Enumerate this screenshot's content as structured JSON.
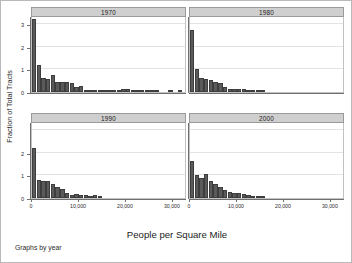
{
  "figure": {
    "xlabel": "People per Square Mile",
    "ylabel": "Fraction of Total Tracts",
    "note": "Graphs by year",
    "bar_color": "#5a5a5a",
    "panel_header_color": "#cfcfcf"
  },
  "chart_data": {
    "type": "bar",
    "title": "",
    "xlabel": "People per Square Mile",
    "ylabel": "Fraction of Total Tracts",
    "xlim": [
      0,
      33000
    ],
    "ylim": [
      0,
      3.35
    ],
    "xticks": [
      0,
      10000,
      20000,
      30000
    ],
    "xticklabels": [
      "0",
      "10,000",
      "20,000",
      "30,000"
    ],
    "yticks": [
      0,
      1,
      2,
      3
    ],
    "yticklabels": [
      "0",
      "1",
      "2",
      "3"
    ],
    "grid": true,
    "legend": "none",
    "layout": "2x2 small multiples by year",
    "bin_width": 1000,
    "panels": [
      {
        "title": "1970",
        "row": 0,
        "col": 0,
        "bin_centers": [
          500,
          1500,
          2500,
          3500,
          4500,
          5500,
          6500,
          7500,
          8500,
          9500,
          10500,
          11500,
          12500,
          13500,
          14500,
          15500,
          16500,
          17500,
          18500,
          19500,
          20500,
          21500,
          22500,
          23500,
          24500,
          25500,
          26500,
          27500,
          28500,
          29500,
          30500,
          31500
        ],
        "values": [
          3.22,
          1.18,
          0.6,
          0.58,
          0.74,
          0.44,
          0.46,
          0.44,
          0.4,
          0.22,
          0.26,
          0.1,
          0.08,
          0.09,
          0.08,
          0.05,
          0.07,
          0.06,
          0.05,
          0.12,
          0.12,
          0.11,
          0.08,
          0.07,
          0.05,
          0.04,
          0.03,
          0,
          0,
          0.03,
          0,
          0.03
        ]
      },
      {
        "title": "1980",
        "row": 0,
        "col": 1,
        "bin_centers": [
          500,
          1500,
          2500,
          3500,
          4500,
          5500,
          6500,
          7500,
          8500,
          9500,
          10500,
          11500,
          12500,
          13500,
          14500,
          15500
        ],
        "values": [
          2.72,
          1.0,
          0.62,
          0.58,
          0.52,
          0.45,
          0.38,
          0.24,
          0.14,
          0.13,
          0.15,
          0.12,
          0.07,
          0.05,
          0.04,
          0.02
        ]
      },
      {
        "title": "1990",
        "row": 1,
        "col": 0,
        "bin_centers": [
          500,
          1500,
          2500,
          3500,
          4500,
          5500,
          6500,
          7500,
          8500,
          9500,
          10500,
          11500,
          12500,
          13500,
          14500
        ],
        "values": [
          2.22,
          0.8,
          0.74,
          0.74,
          0.62,
          0.5,
          0.38,
          0.22,
          0.14,
          0.16,
          0.14,
          0.12,
          0.1,
          0.13,
          0.04
        ]
      },
      {
        "title": "2000",
        "row": 1,
        "col": 1,
        "bin_centers": [
          500,
          1500,
          2500,
          3500,
          4500,
          5500,
          6500,
          7500,
          8500,
          9500,
          10500,
          11500,
          12500,
          13500,
          14500,
          15500
        ],
        "values": [
          1.62,
          1.0,
          0.9,
          1.05,
          0.76,
          0.62,
          0.5,
          0.34,
          0.26,
          0.24,
          0.22,
          0.18,
          0.12,
          0.1,
          0.07,
          0.05
        ]
      }
    ]
  }
}
